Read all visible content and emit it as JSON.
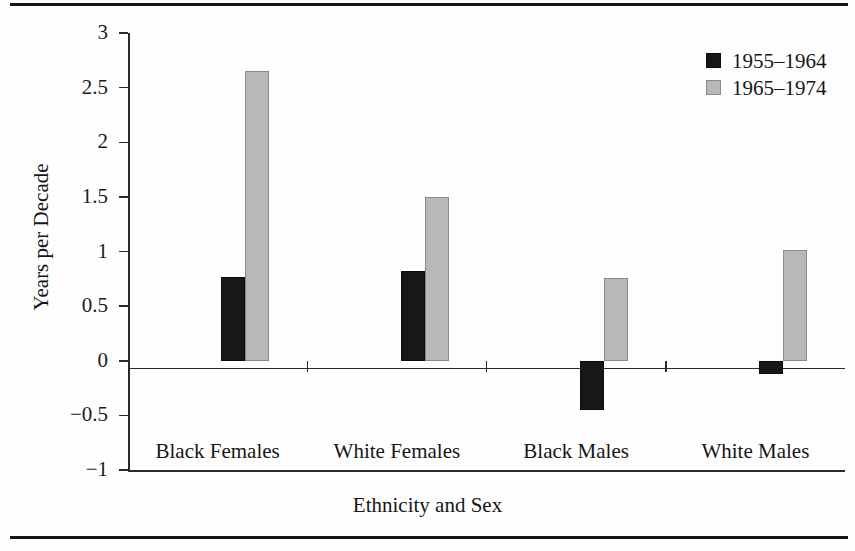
{
  "figure": {
    "rules": {
      "top": "horizontal-rule",
      "bottom": "horizontal-rule"
    }
  },
  "chart_data": {
    "type": "bar",
    "title": "",
    "subtitle": "",
    "xlabel": "Ethnicity and Sex",
    "ylabel": "Years per Decade",
    "categories": [
      "Black Females",
      "White Females",
      "Black Males",
      "White Males"
    ],
    "series": [
      {
        "name": "1955–1964",
        "color": "#171717",
        "values": [
          0.77,
          0.82,
          -0.45,
          -0.12
        ]
      },
      {
        "name": "1965–1974",
        "color": "#b8b8b8",
        "values": [
          2.65,
          1.5,
          0.76,
          1.01
        ]
      }
    ],
    "ylim": [
      -1,
      3
    ],
    "ytick_values": [
      3,
      2.5,
      2,
      1.5,
      1,
      0.5,
      0,
      -0.5,
      -1
    ],
    "ytick_labels": [
      "3",
      "2.5",
      "2",
      "1.5",
      "1",
      "0.5",
      "0",
      "−0.5",
      "−1"
    ],
    "grid": false,
    "legend_position": "top-right",
    "baseline_value": 0,
    "annotations": []
  },
  "legend": {
    "entries": [
      {
        "label": "1955–1964",
        "swatch": "black-square"
      },
      {
        "label": "1965–1974",
        "swatch": "gray-square"
      }
    ]
  }
}
